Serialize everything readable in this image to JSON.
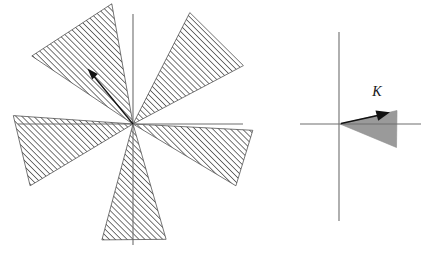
{
  "figure": {
    "background_color": "#ffffff",
    "width": 437,
    "height": 261
  },
  "panels": [
    {
      "id": "left-panel",
      "name": "multi-sector-cone-panel",
      "origin": {
        "x": 133,
        "y": 124
      },
      "axes": {
        "horizontal": {
          "x1": 18,
          "y1": 124,
          "x2": 243,
          "y2": 124,
          "color": "#6e6e6e"
        },
        "vertical": {
          "x1": 133,
          "y1": 14,
          "x2": 133,
          "y2": 245,
          "color": "#6e6e6e"
        }
      },
      "fill_style": "diagonal-hatch",
      "hatch": {
        "angle_deg": 45,
        "spacing": 4,
        "stroke": "#4a4a4a",
        "stroke_width": 0.75
      },
      "sectors": [
        {
          "name": "sector-upper-left",
          "start_deg": 100,
          "end_deg": 146,
          "radius": 122
        },
        {
          "name": "sector-upper-right",
          "start_deg": 28,
          "end_deg": 63,
          "radius": 125
        },
        {
          "name": "sector-lower-right",
          "start_deg": -31,
          "end_deg": -3,
          "radius": 120
        },
        {
          "name": "sector-bottom",
          "start_deg": -105,
          "end_deg": -74,
          "radius": 120
        },
        {
          "name": "sector-left",
          "start_deg": 176,
          "end_deg": 211,
          "radius": 120
        }
      ],
      "vector": {
        "name": "direction-vector",
        "from": {
          "x": 133,
          "y": 124
        },
        "to": {
          "x": 89,
          "y": 70
        },
        "color": "#121212",
        "has_arrowhead": true
      }
    },
    {
      "id": "right-panel",
      "name": "single-cone-panel",
      "origin": {
        "x": 339,
        "y": 124
      },
      "axes": {
        "horizontal": {
          "x1": 300,
          "y1": 124,
          "x2": 421,
          "y2": 124,
          "color": "#6e6e6e"
        },
        "vertical": {
          "x1": 339,
          "y1": 32,
          "x2": 339,
          "y2": 221,
          "color": "#6e6e6e"
        }
      },
      "fill_style": "solid-gray",
      "cone": {
        "name": "cone-K",
        "apex": {
          "x": 340,
          "y": 124
        },
        "upper_edge": {
          "x": 397,
          "y": 111
        },
        "lower_edge": {
          "x": 396,
          "y": 147
        },
        "fill_color": "#9a9a9a",
        "stroke_color": "#8d8d8d"
      },
      "label": {
        "name": "cone-label-K",
        "text": "K",
        "x": 377,
        "y": 96,
        "style": "italic-serif"
      },
      "vector": {
        "name": "cone-axis-vector",
        "from": {
          "x": 341,
          "y": 124
        },
        "to": {
          "x": 389,
          "y": 113
        },
        "color": "#121212",
        "has_arrowhead": true
      }
    }
  ]
}
